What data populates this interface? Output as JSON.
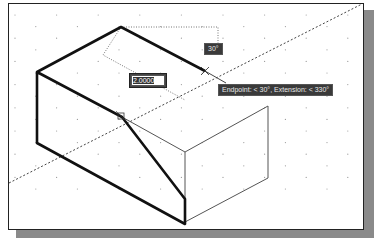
{
  "viewport": {
    "grid": "dotted isometric snap grid",
    "background": "#ffffff"
  },
  "dynamic_input": {
    "value": "2.0000",
    "angle_label": "30°"
  },
  "tooltip": {
    "text": "Endpoint: < 30°, Extension: < 330°"
  },
  "snap_marker": {
    "label": "endpoint-snap"
  },
  "colors": {
    "frame": "#222222",
    "shadow": "#8a8a8a",
    "thick_line": "#111111",
    "thin_line": "#555555",
    "tooltip_bg": "#3a3a3a",
    "tooltip_text": "#e8e8e8"
  }
}
